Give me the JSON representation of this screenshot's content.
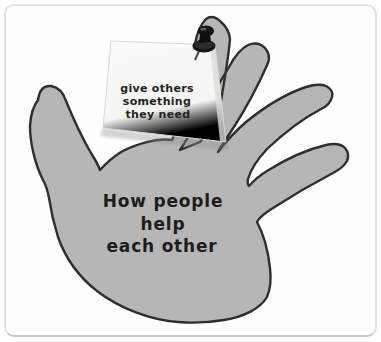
{
  "artwork": {
    "kind": "paper hand cutout with pinned sticky note",
    "note": {
      "lines": [
        "give others",
        "something",
        "they need"
      ]
    },
    "palm": {
      "lines": [
        "How people",
        "help",
        "each other"
      ]
    },
    "icons": {
      "pin": "push-pin-icon"
    },
    "colors": {
      "hand": "#b6b6b6",
      "hand_outline": "#2e2e2e",
      "note_paper": "#f7f7f4",
      "note_shadow": "#8f8f8f",
      "pin": "#141414",
      "text": "#1c1c1c",
      "frame_border": "#e2e2e2",
      "background": "#ffffff"
    }
  }
}
